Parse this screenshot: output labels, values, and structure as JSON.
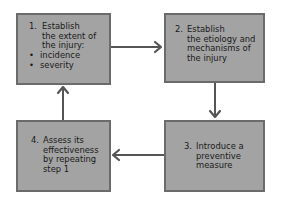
{
  "diagram": {
    "type": "cycle",
    "colors": {
      "box_fill": "#a3a3a3",
      "box_border": "#6b6b6b",
      "arrow": "#555555",
      "text": "#1a1a1a"
    },
    "steps": [
      {
        "number": "1.",
        "lines": [
          "Establish",
          "the extent of",
          "the injury:"
        ],
        "bullets": [
          "incidence",
          "severity"
        ]
      },
      {
        "number": "2.",
        "lines": [
          "Establish",
          "the etiology and",
          "mechanisms of",
          "the injury"
        ]
      },
      {
        "number": "3.",
        "lines": [
          "Introduce a",
          "preventive",
          "measure"
        ]
      },
      {
        "number": "4.",
        "lines": [
          "Assess its",
          "effectiveness",
          "by repeating",
          "step 1"
        ]
      }
    ],
    "connections": [
      {
        "from": 1,
        "to": 2,
        "direction": "right"
      },
      {
        "from": 2,
        "to": 3,
        "direction": "down"
      },
      {
        "from": 3,
        "to": 4,
        "direction": "left"
      },
      {
        "from": 4,
        "to": 1,
        "direction": "up"
      }
    ]
  }
}
